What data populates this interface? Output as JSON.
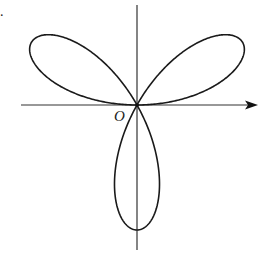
{
  "figure": {
    "label_mark": ".",
    "origin_label": "O",
    "curve": {
      "type": "rose",
      "equation": "r = a·sin(3θ)",
      "petals": 3,
      "petal_directions_deg": [
        30,
        150,
        270
      ]
    },
    "axes": {
      "x_axis_arrow": true,
      "y_axis_arrow": false
    },
    "colors": {
      "stroke": "#1a1a1a",
      "background": "#ffffff"
    }
  }
}
